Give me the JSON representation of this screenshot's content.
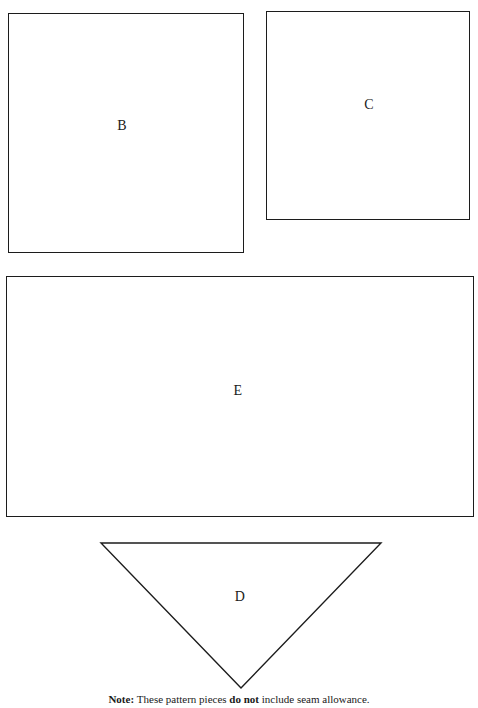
{
  "document": {
    "type": "sewing-pattern-piece-sheet",
    "background_color": "#ffffff",
    "line_color": "#1c1c1c",
    "text_color": "#1a1a1a"
  },
  "pieces": [
    {
      "id": "B",
      "label": "B",
      "shape": "rectangle",
      "x": 8,
      "y": 13,
      "width": 236,
      "height": 240
    },
    {
      "id": "C",
      "label": "C",
      "shape": "rectangle",
      "x": 266,
      "y": 11,
      "width": 204,
      "height": 209
    },
    {
      "id": "E",
      "label": "E",
      "shape": "rectangle",
      "x": 6,
      "y": 276,
      "width": 468,
      "height": 241
    },
    {
      "id": "D",
      "label": "D",
      "shape": "triangle-down",
      "x": 96,
      "y": 538,
      "width": 290,
      "height": 156,
      "points": "5,5 285,5 145,150"
    }
  ],
  "note": {
    "prefix": "Note:",
    "middle": "These pattern pieces",
    "emphasis": "do not",
    "suffix": "include seam allowance.",
    "full_text": "Note: These pattern pieces do not include seam allowance."
  }
}
